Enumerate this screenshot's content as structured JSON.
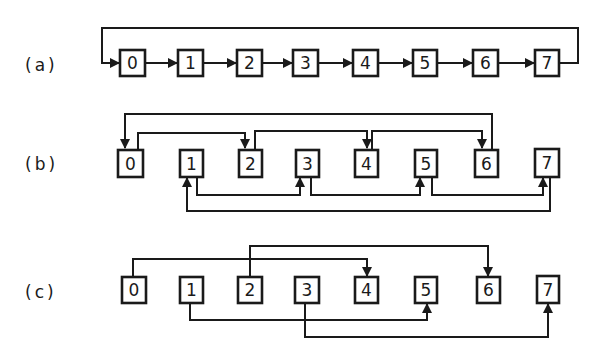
{
  "diagram": {
    "colors": {
      "ink": "#1a1a1a",
      "background": "#ffffff"
    },
    "rows": [
      {
        "label": "(a)",
        "nodes": [
          "0",
          "1",
          "2",
          "3",
          "4",
          "5",
          "6",
          "7"
        ],
        "edges": [
          {
            "from": "0",
            "to": "1"
          },
          {
            "from": "1",
            "to": "2"
          },
          {
            "from": "2",
            "to": "3"
          },
          {
            "from": "3",
            "to": "4"
          },
          {
            "from": "4",
            "to": "5"
          },
          {
            "from": "5",
            "to": "6"
          },
          {
            "from": "6",
            "to": "7"
          },
          {
            "from": "7",
            "to": "0",
            "routing": "top-loop"
          }
        ]
      },
      {
        "label": "(b)",
        "nodes": [
          "0",
          "1",
          "2",
          "3",
          "4",
          "5",
          "6",
          "7"
        ],
        "edges": [
          {
            "from": "0",
            "to": "2"
          },
          {
            "from": "2",
            "to": "4"
          },
          {
            "from": "4",
            "to": "6"
          },
          {
            "from": "6",
            "to": "0"
          },
          {
            "from": "1",
            "to": "3"
          },
          {
            "from": "3",
            "to": "5"
          },
          {
            "from": "5",
            "to": "7"
          },
          {
            "from": "7",
            "to": "1"
          }
        ]
      },
      {
        "label": "(c)",
        "nodes": [
          "0",
          "1",
          "2",
          "3",
          "4",
          "5",
          "6",
          "7"
        ],
        "edges": [
          {
            "from": "0",
            "to": "4",
            "bidirectional": true
          },
          {
            "from": "2",
            "to": "6",
            "bidirectional": true
          },
          {
            "from": "1",
            "to": "5",
            "bidirectional": true
          },
          {
            "from": "3",
            "to": "7",
            "bidirectional": true
          }
        ]
      }
    ]
  }
}
